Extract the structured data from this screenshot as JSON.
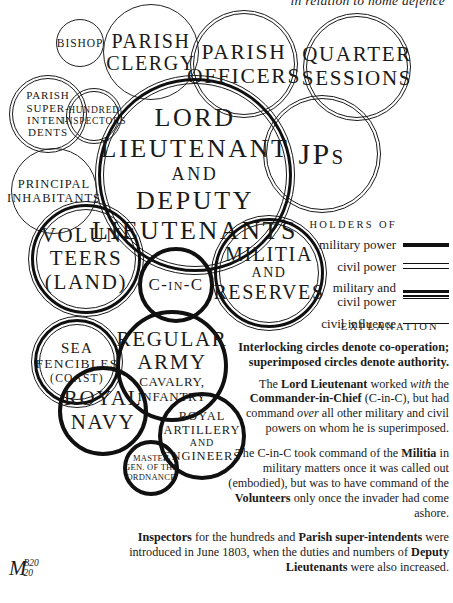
{
  "header": {
    "clipped_title": "in relation to home defence"
  },
  "colors": {
    "ink": "#1a1a1a",
    "background": "#ffffff"
  },
  "circles": [
    {
      "id": "bishop",
      "ring": "civil-influence",
      "lines": [
        "BISHOP"
      ]
    },
    {
      "id": "parish-clergy",
      "ring": "civil-influence",
      "lines": [
        "PARISH",
        "CLERGY"
      ]
    },
    {
      "id": "parish-officers",
      "ring": "civil-power",
      "lines": [
        "PARISH",
        "OFFICERS"
      ]
    },
    {
      "id": "quarter-sessions",
      "ring": "civil-power",
      "lines": [
        "QUARTER",
        "SESSIONS"
      ]
    },
    {
      "id": "parish-superintendents",
      "ring": "civil-power",
      "lines": [
        "PARISH",
        "SUPER-",
        "INTEN-",
        "DENTS"
      ]
    },
    {
      "id": "hundred-inspectors",
      "ring": "civil-power",
      "lines": [
        "HUNDRED",
        "INSPECTORS"
      ]
    },
    {
      "id": "jps",
      "ring": "civil-power",
      "lines": [
        "JPs"
      ]
    },
    {
      "id": "principal-inhabitants",
      "ring": "civil-influence",
      "lines": [
        "PRINCIPAL",
        "INHABITANTS"
      ]
    },
    {
      "id": "lord-lieutenant-and-deputy-lieutenants",
      "ring": "military-and-civil-power",
      "lines": [
        "LORD",
        "LIEUTENANT",
        "AND",
        "DEPUTY",
        "LIEUTENANTS"
      ]
    },
    {
      "id": "volunteers-land",
      "ring": "military-and-civil-power",
      "lines": [
        "VOLUN-",
        "TEERS",
        "(LAND)"
      ]
    },
    {
      "id": "c-in-c",
      "ring": "military-power",
      "lines": [
        "C-in-C"
      ]
    },
    {
      "id": "militia-and-reserves",
      "ring": "military-and-civil-power",
      "lines": [
        "MILITIA",
        "AND",
        "RESERVES"
      ]
    },
    {
      "id": "sea-fencibles-coast",
      "ring": "military-and-civil-power",
      "lines": [
        "SEA",
        "FENCIBLES",
        "(COAST)"
      ]
    },
    {
      "id": "regular-army",
      "ring": "military-power",
      "lines": [
        "REGULAR",
        "ARMY",
        "CAVALRY,",
        "INFANTRY"
      ]
    },
    {
      "id": "royal-navy",
      "ring": "military-power",
      "lines": [
        "ROYAL",
        "NAVY"
      ]
    },
    {
      "id": "royal-artillery-and-engineers",
      "ring": "military-power",
      "lines": [
        "ROYAL",
        "ARTILLERY",
        "AND",
        "ENGINEERS"
      ]
    },
    {
      "id": "master-gen-of-the-ordnance",
      "ring": "military-power",
      "lines": [
        "MASTER",
        "GEN. OF THE",
        "ORDNANCE"
      ]
    }
  ],
  "legend": {
    "heading": "HOLDERS OF",
    "items": [
      {
        "label": "military power",
        "style": "military-power"
      },
      {
        "label": "civil power",
        "style": "civil-power"
      },
      {
        "label": "military and civil power",
        "style": "military-and-civil-power"
      },
      {
        "label": "civil influence",
        "style": "civil-influence"
      }
    ]
  },
  "explanation": {
    "heading": "EXPLANATION",
    "paragraphs": [
      {
        "runs": [
          {
            "t": "Interlocking circles denote co-operation; superimposed circles denote authority.",
            "b": 1
          }
        ]
      },
      {
        "runs": [
          {
            "t": "The "
          },
          {
            "t": "Lord Lieutenant",
            "b": 1
          },
          {
            "t": " worked "
          },
          {
            "t": "with",
            "i": 1
          },
          {
            "t": " the "
          },
          {
            "t": "Commander-in-Chief",
            "b": 1
          },
          {
            "t": " (C-in-C), but had command "
          },
          {
            "t": "over",
            "i": 1
          },
          {
            "t": " all other military and civil powers on whom he is superimposed."
          }
        ]
      },
      {
        "runs": [
          {
            "t": "The C-in-C took command of the "
          },
          {
            "t": "Militia",
            "b": 1
          },
          {
            "t": " in military matters once it was called out (embodied), but was to have command of the "
          },
          {
            "t": "Volunteers",
            "b": 1
          },
          {
            "t": " only once the invader had come ashore."
          }
        ]
      },
      {
        "runs": [
          {
            "t": "Inspectors",
            "b": 1
          },
          {
            "t": " for the hundreds and "
          },
          {
            "t": "Parish super-intendents",
            "b": 1
          },
          {
            "t": " were introduced in June 1803, when the duties and numbers of "
          },
          {
            "t": "Deputy Lieutenants",
            "b": 1
          },
          {
            "t": " were also increased."
          }
        ]
      }
    ]
  },
  "signature": {
    "letter": "M",
    "top": "B20",
    "bottom": "20"
  }
}
